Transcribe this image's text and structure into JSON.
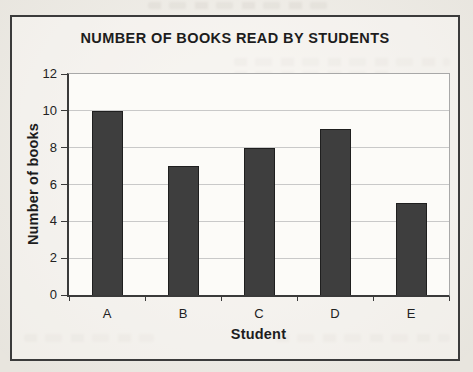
{
  "page": {
    "paper_color": "#efece5"
  },
  "chart": {
    "title": "NUMBER OF BOOKS READ BY STUDENTS",
    "x_axis_title": "Student",
    "y_axis_title": "Number of books"
  },
  "chart_data": {
    "type": "bar",
    "title": "NUMBER OF BOOKS READ BY STUDENTS",
    "categories": [
      "A",
      "B",
      "C",
      "D",
      "E"
    ],
    "values": [
      10,
      7,
      8,
      9,
      5
    ],
    "xlabel": "Student",
    "ylabel": "Number of books",
    "ylim": [
      0,
      12
    ],
    "yticks": [
      0,
      2,
      4,
      6,
      8,
      10,
      12
    ],
    "grid": true,
    "legend": false,
    "colors": {
      "bar": "#3e3e3e",
      "bar_border": "#1f1f1f",
      "gridline": "#c9c9c9",
      "axis": "#3a3a3a",
      "plot_border": "#a8a8a8",
      "plot_background": "#fcfbf8",
      "frame_border": "#3b3b3b",
      "text": "#1d1d1d"
    }
  }
}
